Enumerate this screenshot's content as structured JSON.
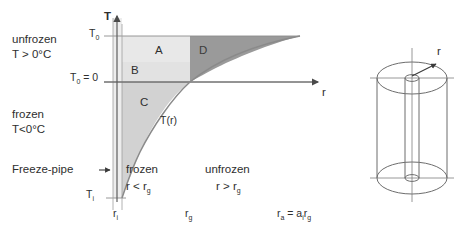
{
  "diagram": {
    "left_text": {
      "unfrozen_line1": "unfrozen",
      "unfrozen_line2": "T > 0°C",
      "frozen_line1": "frozen",
      "frozen_line2": "T<0°C",
      "freeze_pipe": "Freeze-pipe"
    },
    "axes": {
      "y_axis_label": "T",
      "x_axis_label": "r",
      "y_tick_top": "T",
      "y_tick_top_sub": "0",
      "y_tick_zero": "T",
      "y_tick_zero_sub": "0",
      "y_tick_zero_value": " = 0",
      "y_tick_bottom": "T",
      "y_tick_bottom_sub": "i",
      "x_tick_inner": "r",
      "x_tick_inner_sub": "i",
      "x_tick_frost": "r",
      "x_tick_frost_sub": "g",
      "x_tick_outer": "r",
      "x_tick_outer_sub": "a",
      "x_tick_outer_rest": " = a",
      "x_tick_outer_rest_sub": "i",
      "x_tick_outer_rest2": "r",
      "x_tick_outer_rest2_sub": "g"
    },
    "regions": {
      "a": "A",
      "b": "B",
      "c": "C",
      "d": "D"
    },
    "curve_label": "T(r)",
    "zones": {
      "frozen_title": "frozen",
      "frozen_cond": "r < r",
      "frozen_cond_sub": "g",
      "unfrozen_title": "unfrozen",
      "unfrozen_cond": "r > r",
      "unfrozen_cond_sub": "g"
    },
    "cylinder": {
      "radius_label": "r"
    },
    "colors": {
      "region_a": "#e8e8e8",
      "region_b": "#e0e0e0",
      "region_c": "#d2d2d2",
      "region_d": "#9a9a9a",
      "pipe_band": "#ededed",
      "axis": "#6f6f6f",
      "curve": "#8a8a8a",
      "text": "#2e2e2e"
    }
  }
}
